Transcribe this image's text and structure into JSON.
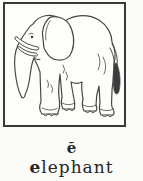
{
  "card": {
    "phonetic_symbol": "ĕ",
    "word": "elephant",
    "word_initial": "e",
    "word_remainder": "lephant",
    "illustration": "elephant-line-drawing"
  },
  "colors": {
    "page_background": "#fbfbf8",
    "frame_border": "#3a3a3a",
    "line_art": "#474747",
    "tail_tuft": "#3c3c3c",
    "text": "#262626"
  }
}
